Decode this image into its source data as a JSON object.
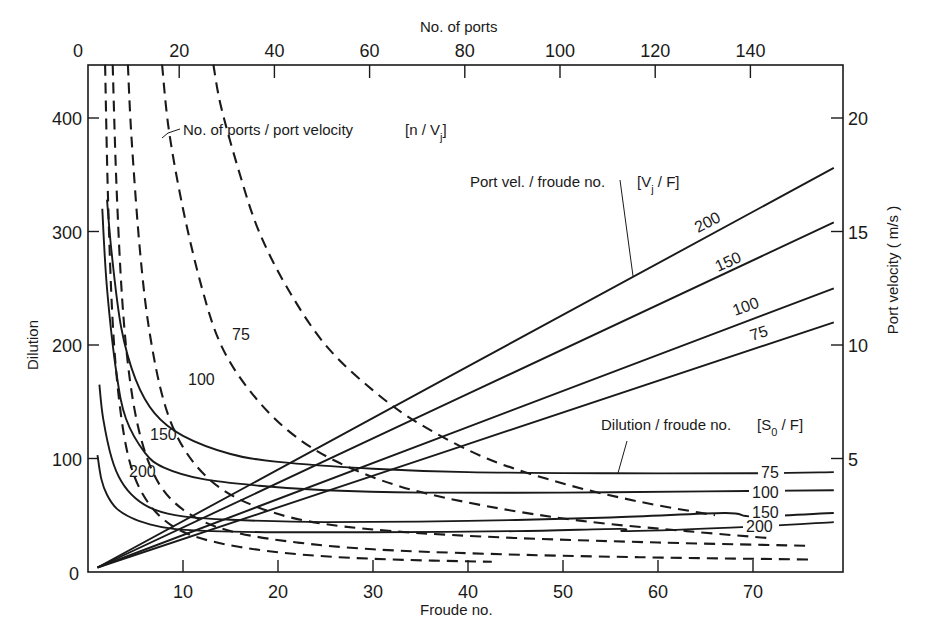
{
  "chart_data": {
    "type": "line",
    "title": "",
    "axes": {
      "x_bottom": {
        "label": "Froude no.",
        "ticks": [
          10,
          20,
          30,
          40,
          50,
          60,
          70
        ],
        "range": [
          0,
          79.5
        ],
        "origin_label": "0"
      },
      "x_top": {
        "label": "No. of ports",
        "ticks": [
          0,
          20,
          40,
          60,
          80,
          100,
          120,
          140
        ],
        "range": [
          0,
          159
        ]
      },
      "y_left": {
        "label": "Dilution",
        "ticks": [
          0,
          100,
          200,
          300,
          400
        ],
        "range": [
          0,
          447
        ]
      },
      "y_right": {
        "label": "Port velocity ( m/s )",
        "ticks": [
          5,
          10,
          15,
          20
        ],
        "range": [
          0,
          22.35
        ]
      }
    },
    "grid": false,
    "legend": "inline annotations",
    "annotations": [
      {
        "id": "n_vj",
        "text": "No. of ports / port velocity [n/Vj]"
      },
      {
        "id": "vj_f",
        "text": "Port vel. / froude no. [Vj / F]"
      },
      {
        "id": "s0_f",
        "text": "Dilution / froude no. [S0/F]"
      }
    ],
    "series": [
      {
        "group": "Port vel./froude no. [Vj/F]",
        "name": "200",
        "style": "solid",
        "axes": "F-velocity",
        "x": [
          1,
          78.5
        ],
        "y": [
          0.2,
          17.8
        ]
      },
      {
        "group": "Port vel./froude no. [Vj/F]",
        "name": "150",
        "style": "solid",
        "axes": "F-velocity",
        "x": [
          1,
          78.5
        ],
        "y": [
          0.2,
          15.4
        ]
      },
      {
        "group": "Port vel./froude no. [Vj/F]",
        "name": "100",
        "style": "solid",
        "axes": "F-velocity",
        "x": [
          1,
          78.5
        ],
        "y": [
          0.2,
          12.5
        ]
      },
      {
        "group": "Port vel./froude no. [Vj/F]",
        "name": "75",
        "style": "solid",
        "axes": "F-velocity",
        "x": [
          1,
          78.5
        ],
        "y": [
          0.2,
          11.0
        ]
      },
      {
        "group": "Dilution/froude no. [S0/F]",
        "name": "75",
        "style": "solid",
        "axes": "F-dilution",
        "x": [
          2.0,
          2.5,
          3.5,
          5,
          7,
          10,
          15,
          20,
          30,
          40,
          55,
          70,
          78.5
        ],
        "y": [
          328,
          280,
          215,
          170,
          140,
          120,
          104,
          97,
          91,
          88,
          87,
          87,
          88
        ]
      },
      {
        "group": "Dilution/froude no. [S0/F]",
        "name": "100",
        "style": "solid",
        "axes": "F-dilution",
        "x": [
          1.5,
          2,
          3,
          4,
          6,
          8,
          12,
          18,
          25,
          35,
          50,
          65,
          78.5
        ],
        "y": [
          320,
          250,
          175,
          135,
          105,
          92,
          82,
          76,
          72,
          70,
          70,
          71,
          72
        ]
      },
      {
        "group": "Dilution/froude no. [S0/F]",
        "name": "150",
        "style": "solid",
        "axes": "F-dilution",
        "x": [
          1.2,
          1.6,
          2.5,
          3.5,
          5,
          7,
          10,
          15,
          25,
          40,
          55,
          67,
          70,
          78.5
        ],
        "y": [
          165,
          135,
          100,
          80,
          65,
          55,
          49,
          46,
          44,
          45,
          48,
          52,
          49,
          52
        ]
      },
      {
        "group": "Dilution/froude no. [S0/F]",
        "name": "200",
        "style": "solid",
        "axes": "F-dilution",
        "x": [
          1.0,
          1.4,
          2,
          3,
          4.5,
          6.5,
          9,
          13,
          20,
          30,
          45,
          56,
          57,
          70,
          78.5
        ],
        "y": [
          103,
          82,
          68,
          56,
          48,
          42,
          38,
          36,
          35,
          35,
          36,
          38,
          36,
          40,
          44
        ]
      },
      {
        "group": "No. of ports/port velocity [n/Vj]",
        "name": "75",
        "style": "dashed",
        "axes": "F-dilution",
        "x": [
          13.2,
          14.0,
          16,
          18,
          21,
          25,
          30,
          35,
          42,
          50,
          58,
          66
        ],
        "y": [
          447,
          410,
          350,
          300,
          250,
          200,
          160,
          130,
          100,
          78,
          62,
          50
        ]
      },
      {
        "group": "No. of ports/port velocity [n/Vj]",
        "name": "100",
        "style": "dashed",
        "axes": "F-dilution",
        "x": [
          7.8,
          8.5,
          10,
          12,
          14,
          17,
          21,
          26,
          33,
          42,
          52,
          63,
          71.5
        ],
        "y": [
          447,
          390,
          320,
          250,
          200,
          160,
          125,
          98,
          75,
          58,
          45,
          36,
          30
        ]
      },
      {
        "group": "No. of ports/port velocity [n/Vj]",
        "name": "150",
        "style": "dashed",
        "axes": "F-dilution",
        "x": [
          4.2,
          4.6,
          5.5,
          6.5,
          8,
          10,
          13,
          17,
          23,
          32,
          45,
          60,
          76
        ],
        "y": [
          447,
          380,
          280,
          210,
          150,
          110,
          80,
          60,
          45,
          36,
          30,
          26,
          23
        ]
      },
      {
        "group": "No. of ports/port velocity [n/Vj]",
        "name": "200",
        "style": "dashed",
        "axes": "F-dilution",
        "x": [
          2.6,
          3.0,
          3.6,
          4.4,
          5.5,
          7,
          9,
          12,
          16,
          22,
          30,
          42,
          58,
          76
        ],
        "y": [
          447,
          340,
          240,
          170,
          120,
          85,
          62,
          45,
          34,
          26,
          20,
          16,
          13,
          11
        ]
      },
      {
        "group": "No. of ports/port velocity [n/Vj]",
        "name": "unlabeled",
        "style": "dashed",
        "axes": "F-dilution",
        "x": [
          1.8,
          2.1,
          2.6,
          3.3,
          4.3,
          5.8,
          8,
          11,
          16,
          23,
          32,
          42.5
        ],
        "y": [
          447,
          330,
          220,
          150,
          100,
          68,
          46,
          32,
          22,
          15,
          11,
          9
        ]
      }
    ]
  },
  "labels": {
    "x_bottom_title": "Froude no.",
    "x_top_title": "No. of ports",
    "y_left_title": "Dilution",
    "y_right_title": "Port velocity ( m/s )",
    "annot_nvj": "No. of ports / port velocity",
    "annot_nvj_bracket": "[n / Vj]",
    "annot_vjf": "Port vel. / froude no.",
    "annot_vjf_bracket": "[Vj / F]",
    "annot_s0f": "Dilution / froude no.",
    "annot_s0f_bracket": "[S0 / F]"
  }
}
